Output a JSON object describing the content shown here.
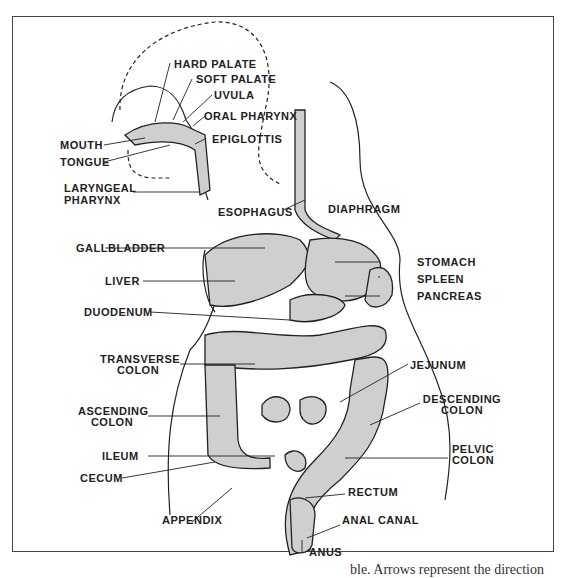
{
  "figure": {
    "labels": {
      "hard_palate": "HARD PALATE",
      "soft_palate": "SOFT PALATE",
      "uvula": "UVULA",
      "oral_pharynx": "ORAL PHARYNX",
      "mouth": "MOUTH",
      "epiglottis": "EPIGLOTTIS",
      "tongue": "TONGUE",
      "laryngeal_pharynx_1": "LARYNGEAL",
      "laryngeal_pharynx_2": "PHARYNX",
      "esophagus": "ESOPHAGUS",
      "diaphragm": "DIAPHRAGM",
      "gallbladder": "GALLBLADDER",
      "stomach": "STOMACH",
      "liver": "LIVER",
      "spleen": "SPLEEN",
      "pancreas": "PANCREAS",
      "duodenum": "DUODENUM",
      "transverse_colon_1": "TRANSVERSE",
      "transverse_colon_2": "COLON",
      "jejunum": "JEJUNUM",
      "ascending_colon_1": "ASCENDING",
      "ascending_colon_2": "COLON",
      "descending_colon_1": "DESCENDING",
      "descending_colon_2": "COLON",
      "ileum": "ILEUM",
      "pelvic_colon_1": "PELVIC",
      "pelvic_colon_2": "COLON",
      "cecum": "CECUM",
      "rectum": "RECTUM",
      "appendix": "APPENDIX",
      "anal_canal": "ANAL CANAL",
      "anus": "ANUS"
    },
    "caption_fragment": "ble. Arrows represent the direction"
  }
}
